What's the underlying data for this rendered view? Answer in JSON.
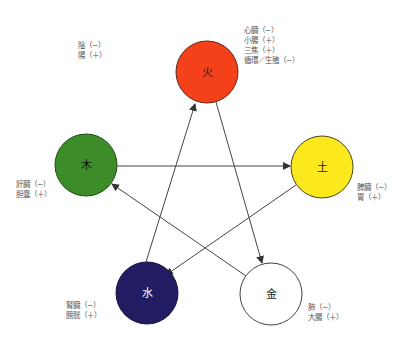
{
  "diagram": {
    "title": "",
    "legend": {
      "lines": [
        "陰（−）",
        "陽（＋）"
      ]
    },
    "elements": [
      {
        "id": "fire",
        "symbol": "火",
        "color": "#f5411a",
        "text_color": "#222222",
        "cx": 207,
        "cy": 72,
        "r": 31,
        "organs": [
          "心臓（−）",
          "小腸（＋）",
          "三焦（＋）",
          "循環／生殖（−）"
        ]
      },
      {
        "id": "earth",
        "symbol": "土",
        "color": "#fbe91d",
        "text_color": "#222222",
        "cx": 322,
        "cy": 167,
        "r": 31,
        "organs": [
          "脾臓（−）",
          "胃（＋）"
        ]
      },
      {
        "id": "metal",
        "symbol": "金",
        "color": "#ffffff",
        "text_color": "#222222",
        "cx": 271,
        "cy": 294,
        "r": 31,
        "organs": [
          "肺（−）",
          "大腸（＋）"
        ]
      },
      {
        "id": "water",
        "symbol": "水",
        "color": "#221d63",
        "text_color": "#ffffff",
        "cx": 147,
        "cy": 293,
        "r": 31,
        "organs": [
          "腎臓（−）",
          "膀胱（＋）"
        ]
      },
      {
        "id": "wood",
        "symbol": "木",
        "color": "#3c8d2a",
        "text_color": "#111111",
        "cx": 86,
        "cy": 165,
        "r": 31,
        "organs": [
          "肝臓（−）",
          "胆嚢（＋）"
        ]
      }
    ],
    "arrows": [
      {
        "from": "wood",
        "to": "earth"
      },
      {
        "from": "earth",
        "to": "water"
      },
      {
        "from": "water",
        "to": "fire"
      },
      {
        "from": "fire",
        "to": "metal"
      },
      {
        "from": "metal",
        "to": "wood"
      }
    ]
  }
}
